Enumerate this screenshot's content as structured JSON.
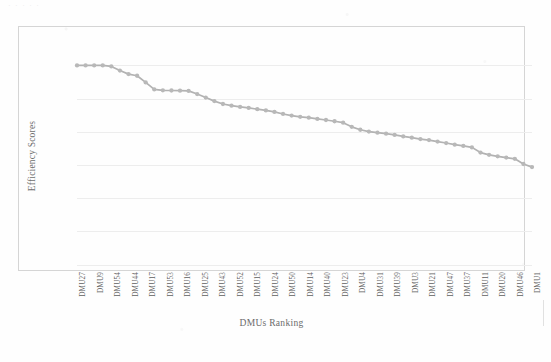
{
  "page": {
    "background_color": "#fefefe",
    "artifact_text": "· · · · ·"
  },
  "chart_data": {
    "type": "line",
    "title": "",
    "subtitle": "",
    "xlabel": "DMUs Ranking",
    "ylabel": "Efficiency Scores",
    "grid": true,
    "legend": null,
    "legend_position": "none",
    "marker": "circle",
    "line_color": "#b2b2b2",
    "marker_color": "#b8b8b8",
    "grid_color": "#ededed",
    "frame_color": "#d5d5d5",
    "text_color": "#5f5f5f",
    "ylim": [
      0,
      1.05
    ],
    "xlim": [
      0,
      55
    ],
    "y_tick_labels": [],
    "x_tick_labels": [
      "DMU27",
      "DMU9",
      "DMU54",
      "DMU44",
      "DMU17",
      "DMU53",
      "DMU16",
      "DMU25",
      "DMU43",
      "DMU52",
      "DMU15",
      "DMU24",
      "DMU50",
      "DMU14",
      "DMU40",
      "DMU23",
      "DMU4",
      "DMU31",
      "DMU39",
      "DMU3",
      "DMU21",
      "DMU47",
      "DMU37",
      "DMU11",
      "DMU20",
      "DMU46",
      "DMU1"
    ],
    "x_tick_every": 2,
    "categories": [
      "DMU27",
      "DMU2",
      "DMU9",
      "DMU8",
      "DMU54",
      "DMU19",
      "DMU44",
      "DMU7",
      "DMU17",
      "DMU42",
      "DMU53",
      "DMU6",
      "DMU16",
      "DMU35",
      "DMU25",
      "DMU29",
      "DMU43",
      "DMU18",
      "DMU52",
      "DMU12",
      "DMU15",
      "DMU34",
      "DMU24",
      "DMU45",
      "DMU50",
      "DMU26",
      "DMU14",
      "DMU10",
      "DMU40",
      "DMU48",
      "DMU23",
      "DMU38",
      "DMU4",
      "DMU28",
      "DMU31",
      "DMU13",
      "DMU39",
      "DMU49",
      "DMU3",
      "DMU36",
      "DMU21",
      "DMU32",
      "DMU47",
      "DMU51",
      "DMU37",
      "DMU5",
      "DMU11",
      "DMU41",
      "DMU20",
      "DMU30",
      "DMU46",
      "DMU33",
      "DMU1",
      "DMU22"
    ],
    "values": [
      1.0,
      1.0,
      1.0,
      1.0,
      0.995,
      0.975,
      0.958,
      0.95,
      0.918,
      0.884,
      0.88,
      0.879,
      0.878,
      0.877,
      0.862,
      0.845,
      0.828,
      0.814,
      0.806,
      0.8,
      0.795,
      0.789,
      0.783,
      0.776,
      0.766,
      0.758,
      0.752,
      0.748,
      0.742,
      0.737,
      0.731,
      0.724,
      0.704,
      0.69,
      0.681,
      0.676,
      0.671,
      0.665,
      0.658,
      0.652,
      0.645,
      0.64,
      0.633,
      0.626,
      0.618,
      0.612,
      0.605,
      0.58,
      0.569,
      0.562,
      0.556,
      0.55,
      0.525,
      0.51
    ],
    "gridline_values": [
      1.0,
      0.84,
      0.68,
      0.52,
      0.36,
      0.2,
      0.04
    ]
  }
}
